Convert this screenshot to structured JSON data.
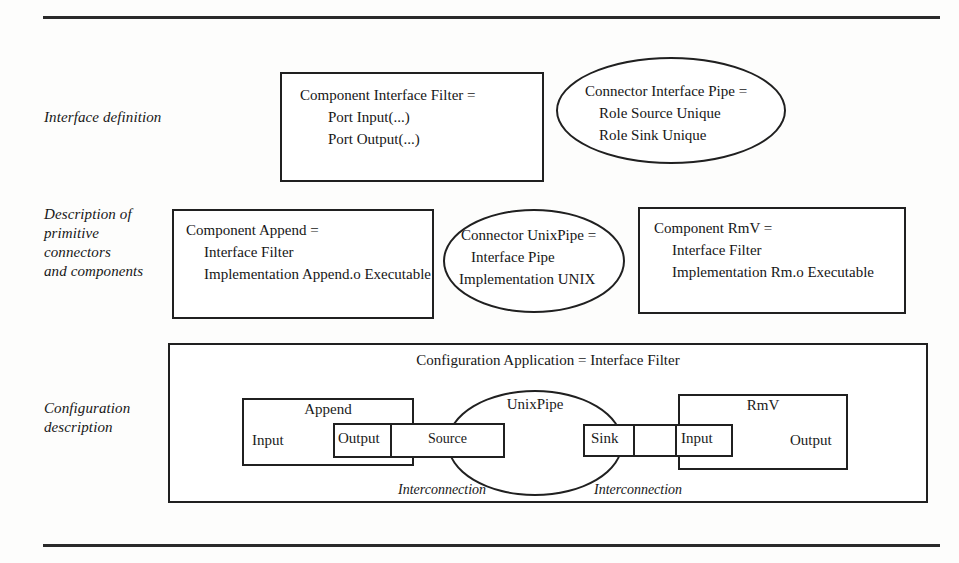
{
  "figure": {
    "rules": {
      "top": "horizontal-rule",
      "bottom": "horizontal-rule"
    }
  },
  "rows": [
    {
      "label": "Interface definition"
    },
    {
      "label_lines": [
        "Description of",
        "primitive",
        "connectors",
        "and components"
      ]
    },
    {
      "label_lines": [
        "Configuration",
        "description"
      ]
    }
  ],
  "interface_definition": {
    "component_spec": {
      "line1": "Component Interface Filter =",
      "line2": "Port Input(...)",
      "line3": "Port Output(...)"
    },
    "connector_spec": {
      "line1": "Connector Interface Pipe =",
      "line2": "Role Source Unique",
      "line3": "Role Sink Unique"
    }
  },
  "primitive_descriptions": {
    "append": {
      "line1": "Component Append =",
      "line2": "Interface Filter",
      "line3": "Implementation Append.o Executable"
    },
    "unixpipe": {
      "line1": "Connector UnixPipe =",
      "line2": "Interface Pipe",
      "line3": "Implementation UNIX"
    },
    "rmv": {
      "line1": "Component RmV =",
      "line2": "Interface Filter",
      "line3": "Implementation Rm.o Executable"
    }
  },
  "configuration": {
    "title": "Configuration Application = Interface Filter",
    "append_instance": {
      "name": "Append",
      "input_port": "Input",
      "output_port": "Output"
    },
    "unixpipe_instance": {
      "name": "UnixPipe",
      "source_role": "Source",
      "sink_role": "Sink"
    },
    "rmv_instance": {
      "name": "RmV",
      "input_port": "Input",
      "output_port": "Output"
    },
    "left_interconnection_label": "Interconnection",
    "right_interconnection_label": "Interconnection"
  },
  "colors": {
    "stroke": "#202020",
    "text": "#161616",
    "background": "#fdfdfc",
    "rule": "#2a2a2a"
  }
}
